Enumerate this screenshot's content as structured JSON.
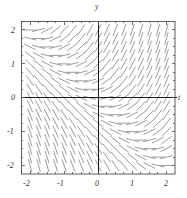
{
  "figure": {
    "kind": "direction-field-plot",
    "background_color": "#ffffff",
    "frame_color": "#4d4d4d",
    "axis_color": "#1a1a1a",
    "segment_color": "#8a8a8a",
    "axis_labels": {
      "horizontal": "t",
      "vertical": "y"
    }
  },
  "chart_data": {
    "type": "scatter",
    "title": "",
    "xlabel": "t",
    "ylabel": "y",
    "xlim": [
      -2.25,
      2.25
    ],
    "ylim": [
      -2.25,
      2.25
    ],
    "grid": false,
    "legend_position": "none",
    "xticks": [
      -2,
      -1,
      0,
      1,
      2
    ],
    "xtick_labels": [
      "-2",
      "-1",
      "0",
      "1",
      "2"
    ],
    "yticks": [
      -2,
      -1,
      0,
      1,
      2
    ],
    "ytick_labels": [
      "2",
      "1",
      "0",
      "-1",
      "-2"
    ],
    "minor_tick_step": 0.25,
    "slope_formula": "dy/dt = t + y",
    "grid_step": 0.25,
    "grid_start": -2.0,
    "grid_end": 2.0,
    "segment_half_length_px": 6.5,
    "sample_points": [
      {
        "t": -2.0,
        "y": 2.0,
        "slope": 0.0
      },
      {
        "t": -1.0,
        "y": 2.0,
        "slope": 1.0
      },
      {
        "t": 0.0,
        "y": 2.0,
        "slope": 2.0
      },
      {
        "t": 1.0,
        "y": 2.0,
        "slope": 3.0
      },
      {
        "t": 2.0,
        "y": 2.0,
        "slope": 4.0
      },
      {
        "t": -2.0,
        "y": 1.0,
        "slope": -1.0
      },
      {
        "t": -1.0,
        "y": 1.0,
        "slope": 0.0
      },
      {
        "t": 0.0,
        "y": 1.0,
        "slope": 1.0
      },
      {
        "t": 1.0,
        "y": 1.0,
        "slope": 2.0
      },
      {
        "t": 2.0,
        "y": 1.0,
        "slope": 3.0
      },
      {
        "t": -2.0,
        "y": 0.0,
        "slope": -2.0
      },
      {
        "t": -1.0,
        "y": 0.0,
        "slope": -1.0
      },
      {
        "t": 0.0,
        "y": 0.0,
        "slope": 0.0
      },
      {
        "t": 1.0,
        "y": 0.0,
        "slope": 1.0
      },
      {
        "t": 2.0,
        "y": 0.0,
        "slope": 2.0
      },
      {
        "t": -2.0,
        "y": -1.0,
        "slope": -3.0
      },
      {
        "t": -1.0,
        "y": -1.0,
        "slope": -2.0
      },
      {
        "t": 0.0,
        "y": -1.0,
        "slope": -1.0
      },
      {
        "t": 1.0,
        "y": -1.0,
        "slope": 0.0
      },
      {
        "t": 2.0,
        "y": -1.0,
        "slope": 1.0
      },
      {
        "t": -2.0,
        "y": -2.0,
        "slope": -4.0
      },
      {
        "t": -1.0,
        "y": -2.0,
        "slope": -3.0
      },
      {
        "t": 0.0,
        "y": -2.0,
        "slope": -2.0
      },
      {
        "t": 1.0,
        "y": -2.0,
        "slope": -1.0
      },
      {
        "t": 2.0,
        "y": -2.0,
        "slope": 0.0
      }
    ]
  },
  "labels": {
    "y_axis_name": "y",
    "t_axis_name": "t",
    "x_tick_2_neg": "-2",
    "x_tick_1_neg": "-1",
    "x_tick_0": "0",
    "x_tick_1": "1",
    "x_tick_2": "2",
    "y_tick_2": "2",
    "y_tick_1": "1",
    "y_tick_0": "0",
    "y_tick_1_neg": "-1",
    "y_tick_2_neg": "-2"
  }
}
